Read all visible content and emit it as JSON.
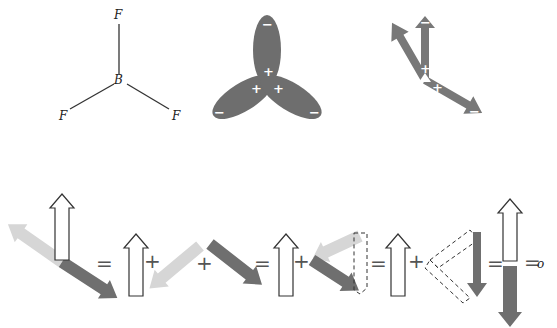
{
  "structure": {
    "central_atom": "B",
    "ligands": [
      "F",
      "F",
      "F"
    ]
  },
  "orbital_model": {
    "lobe_inner_sign": "+",
    "lobe_outer_sign": "−",
    "lobe_count": 3
  },
  "dipole_model": {
    "tail_sign": "+",
    "head_sign": "−",
    "arrow_count": 3
  },
  "equation": {
    "operators": [
      "=",
      "+",
      "+",
      "=",
      "+",
      "=",
      "+",
      "=",
      "="
    ],
    "result": "o"
  },
  "colors": {
    "lobe": "#6e6e6e",
    "dark_arrow": "#6f6f6f",
    "light_arrow": "#d6d6d6",
    "hollow_arrow_stroke": "#333333"
  }
}
